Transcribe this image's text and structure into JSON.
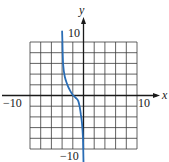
{
  "chart_data": {
    "type": "line",
    "title": "",
    "xlabel": "x",
    "ylabel": "y",
    "xlim": [
      -10,
      10
    ],
    "ylim": [
      -10,
      10
    ],
    "grid": true,
    "grid_step": 2,
    "tick_labels": {
      "x_min": "−10",
      "x_max": "10",
      "y_min": "−10",
      "y_max": "10"
    },
    "series": [
      {
        "name": "curve",
        "color": "#2a6db5",
        "x": [
          -4.0,
          -3.9,
          -3.8,
          -3.5,
          -3.0,
          -2.5,
          -2.0,
          -1.5,
          -1.0,
          -0.7,
          -0.5,
          -0.3,
          -0.1,
          0.0
        ],
        "y": [
          12.0,
          8.5,
          5.7,
          3.5,
          2.0,
          0.9,
          0.1,
          -0.4,
          -1.0,
          -2.2,
          -3.5,
          -5.0,
          -8.0,
          -12.5
        ]
      }
    ]
  },
  "colors": {
    "curve": "#2a6db5",
    "grid": "#2b2b2b",
    "axis": "#1a1a1a"
  }
}
